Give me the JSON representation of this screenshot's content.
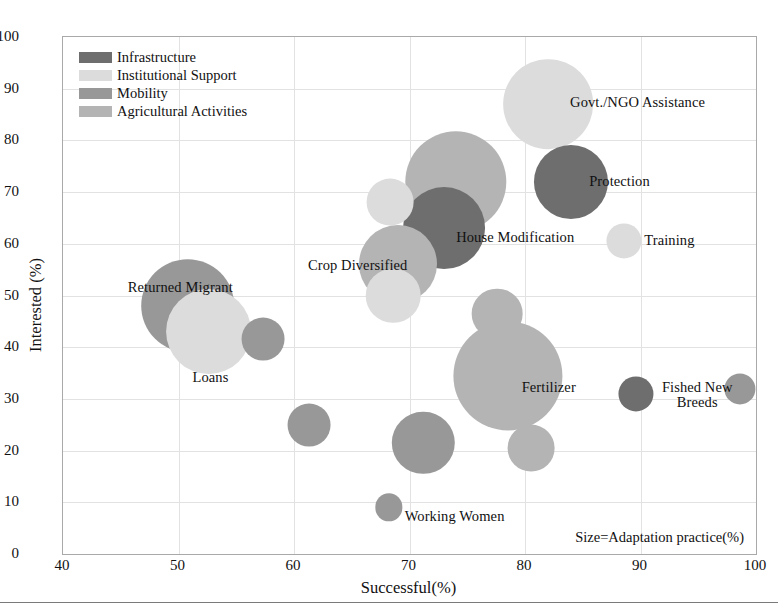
{
  "chart_data": {
    "type": "scatter",
    "title": "",
    "subtitle": "",
    "xlabel": "Successful(%)",
    "ylabel": "Interested (%)",
    "xlim": [
      40,
      100
    ],
    "ylim": [
      0,
      100
    ],
    "xticks": [
      40,
      50,
      60,
      70,
      80,
      90,
      100
    ],
    "yticks": [
      0,
      10,
      20,
      30,
      40,
      50,
      60,
      70,
      80,
      90,
      100
    ],
    "grid": true,
    "legend_position": "top-left",
    "size_note": "Size=Adaptation practice(%)",
    "size_encoding": "Adaptation practice(%)",
    "categories": [
      {
        "name": "Infrastructure",
        "color": "#6e6e6e"
      },
      {
        "name": "Institutional Support",
        "color": "#dcdcdc"
      },
      {
        "name": "Mobility",
        "color": "#989898"
      },
      {
        "name": "Agricultural Activities",
        "color": "#b4b4b4"
      }
    ],
    "points": [
      {
        "label": "Govt./NGO Assistance",
        "x": 82.0,
        "y": 87.0,
        "size": 23,
        "category": "Institutional Support",
        "color": "#dcdcdc"
      },
      {
        "label": "Protection",
        "x": 84.0,
        "y": 72.0,
        "size": 19,
        "category": "Infrastructure",
        "color": "#6e6e6e"
      },
      {
        "label": "Training",
        "x": 88.6,
        "y": 60.5,
        "size": 9,
        "category": "Institutional Support",
        "color": "#dcdcdc"
      },
      {
        "label": "",
        "x": 74.0,
        "y": 72.0,
        "size": 26,
        "category": "Agricultural Activities",
        "color": "#b4b4b4"
      },
      {
        "label": "House Modification",
        "x": 73.0,
        "y": 63.0,
        "size": 21,
        "category": "Infrastructure",
        "color": "#6e6e6e"
      },
      {
        "label": "",
        "x": 68.3,
        "y": 68.0,
        "size": 12,
        "category": "Institutional Support",
        "color": "#dcdcdc"
      },
      {
        "label": "Crop Diversified",
        "x": 69.0,
        "y": 56.0,
        "size": 20,
        "category": "Agricultural Activities",
        "color": "#b4b4b4"
      },
      {
        "label": "",
        "x": 68.6,
        "y": 50.0,
        "size": 14,
        "category": "Institutional Support",
        "color": "#dcdcdc"
      },
      {
        "label": "Returned Migrant",
        "x": 50.8,
        "y": 48.0,
        "size": 24,
        "category": "Mobility",
        "color": "#989898"
      },
      {
        "label": "Loans",
        "x": 52.6,
        "y": 43.0,
        "size": 22,
        "category": "Institutional Support",
        "color": "#dcdcdc"
      },
      {
        "label": "",
        "x": 57.3,
        "y": 41.5,
        "size": 11,
        "category": "Mobility",
        "color": "#989898"
      },
      {
        "label": "",
        "x": 61.3,
        "y": 25.0,
        "size": 11,
        "category": "Mobility",
        "color": "#989898"
      },
      {
        "label": "",
        "x": 77.6,
        "y": 46.5,
        "size": 13,
        "category": "Agricultural Activities",
        "color": "#b4b4b4"
      },
      {
        "label": "Fertilizer",
        "x": 78.5,
        "y": 34.5,
        "size": 28,
        "category": "Agricultural Activities",
        "color": "#b4b4b4"
      },
      {
        "label": "",
        "x": 80.5,
        "y": 20.5,
        "size": 12,
        "category": "Agricultural Activities",
        "color": "#b4b4b4"
      },
      {
        "label": "",
        "x": 71.2,
        "y": 21.5,
        "size": 16,
        "category": "Mobility",
        "color": "#989898"
      },
      {
        "label": "Working Women",
        "x": 68.2,
        "y": 9.0,
        "size": 7,
        "category": "Mobility",
        "color": "#989898"
      },
      {
        "label": "Fished New\nBreeds",
        "x": 89.6,
        "y": 31.0,
        "size": 9,
        "category": "Infrastructure",
        "color": "#6e6e6e"
      },
      {
        "label": "",
        "x": 98.6,
        "y": 32.0,
        "size": 8,
        "category": "Mobility",
        "color": "#989898"
      }
    ]
  },
  "legend": {
    "items": [
      {
        "label": "Infrastructure",
        "color": "#6e6e6e"
      },
      {
        "label": "Institutional Support",
        "color": "#dcdcdc"
      },
      {
        "label": "Mobility",
        "color": "#989898"
      },
      {
        "label": "Agricultural Activities",
        "color": "#b4b4b4"
      }
    ]
  },
  "axes": {
    "x_title": "Successful(%)",
    "y_title": "Interested (%)",
    "x_tick_labels": [
      "40",
      "50",
      "60",
      "70",
      "80",
      "90",
      "100"
    ],
    "y_tick_labels": [
      "0",
      "10",
      "20",
      "30",
      "40",
      "50",
      "60",
      "70",
      "80",
      "90",
      "100"
    ]
  },
  "annotations": {
    "size_note": "Size=Adaptation practice(%)"
  }
}
